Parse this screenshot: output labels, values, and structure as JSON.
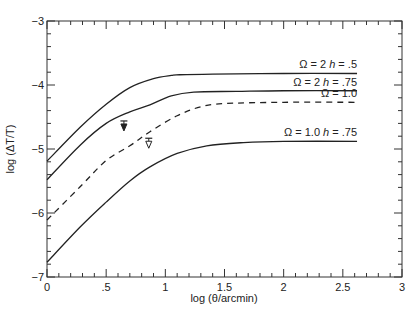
{
  "chart_data": {
    "type": "line",
    "title": "",
    "xlabel": "log (θ/arcmin)",
    "ylabel": "log (ΔT/T)",
    "xlim": [
      0,
      3
    ],
    "ylim": [
      -7,
      -3
    ],
    "grid": false,
    "x_ticks": [
      {
        "value": 0,
        "label": "0"
      },
      {
        "value": 0.5,
        "label": ".5"
      },
      {
        "value": 1,
        "label": "1"
      },
      {
        "value": 1.5,
        "label": "1.5"
      },
      {
        "value": 2,
        "label": "2"
      },
      {
        "value": 2.5,
        "label": "2.5"
      },
      {
        "value": 3,
        "label": "3"
      }
    ],
    "y_ticks": [
      {
        "value": -3,
        "label": "−3"
      },
      {
        "value": -4,
        "label": "−4"
      },
      {
        "value": -5,
        "label": "−5"
      },
      {
        "value": -6,
        "label": "−6"
      },
      {
        "value": -7,
        "label": "−7"
      }
    ],
    "x_minor_step": 0.1,
    "y_minor_step": 0.2,
    "series": [
      {
        "name": "Ω = 2 h = .5",
        "label_omega": "Ω = 2 ",
        "label_h": "h",
        "label_rest": " = .5",
        "style": "solid",
        "x": [
          0,
          0.28,
          0.5,
          0.7,
          0.9,
          1.05,
          1.12,
          1.4,
          2.0,
          2.62
        ],
        "y": [
          -5.19,
          -4.66,
          -4.3,
          -4.04,
          -3.9,
          -3.85,
          -3.84,
          -3.83,
          -3.82,
          -3.82
        ]
      },
      {
        "name": "Ω = 2 h = .75",
        "label_omega": "Ω = 2 ",
        "label_h": "h",
        "label_rest": " = .75",
        "style": "solid",
        "x": [
          0,
          0.28,
          0.5,
          0.7,
          0.87,
          1.05,
          1.24,
          1.6,
          2.0,
          2.62
        ],
        "y": [
          -5.48,
          -4.94,
          -4.6,
          -4.42,
          -4.31,
          -4.17,
          -4.11,
          -4.1,
          -4.09,
          -4.09
        ]
      },
      {
        "name": "Ω = 1.0",
        "label_omega": "Ω = 1.0",
        "label_h": "",
        "label_rest": "",
        "style": "dashed",
        "x": [
          0,
          0.28,
          0.5,
          0.7,
          0.87,
          1.1,
          1.3,
          1.5,
          2.0,
          2.62
        ],
        "y": [
          -6.11,
          -5.59,
          -5.18,
          -4.95,
          -4.73,
          -4.48,
          -4.34,
          -4.29,
          -4.27,
          -4.27
        ]
      },
      {
        "name": "Ω = 1.0 h = .75",
        "label_omega": "Ω = 1.0 ",
        "label_h": "h",
        "label_rest": " = .75",
        "style": "solid",
        "x": [
          0,
          0.28,
          0.5,
          0.7,
          0.87,
          1.1,
          1.35,
          1.66,
          2.0,
          2.62
        ],
        "y": [
          -6.77,
          -6.22,
          -5.83,
          -5.5,
          -5.28,
          -5.07,
          -4.95,
          -4.9,
          -4.88,
          -4.88
        ]
      }
    ],
    "markers": [
      {
        "name": "upper-limit-filled",
        "shape": "filled-down-triangle-with-bar",
        "x": 0.65,
        "y": -4.64
      },
      {
        "name": "upper-limit-open",
        "shape": "open-down-triangle-with-bar",
        "x": 0.86,
        "y": -4.91
      }
    ]
  }
}
